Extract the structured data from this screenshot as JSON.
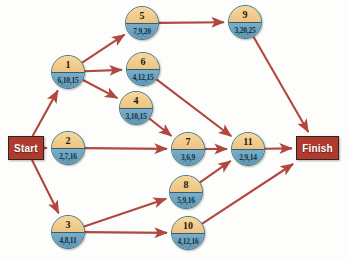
{
  "diagram": {
    "colors": {
      "edge": "#b0483f",
      "terminal_fill": "#b03a2e",
      "terminal_border": "#2b2420",
      "node_top": "#f2cd8b",
      "node_bottom": "#6a9cc0",
      "node_border": "#3c7f96",
      "background": "#fdfdfb"
    },
    "terminals": [
      {
        "key": "start",
        "label": "Start",
        "x": 8,
        "y": 136,
        "w": 36,
        "h": 24
      },
      {
        "key": "finish",
        "label": "Finish",
        "x": 296,
        "y": 136,
        "w": 43,
        "h": 24
      }
    ],
    "nodes": [
      {
        "id": "1",
        "times": "6,10,15",
        "cx": 68,
        "cy": 72
      },
      {
        "id": "2",
        "times": "2,7,16",
        "cx": 68,
        "cy": 148
      },
      {
        "id": "3",
        "times": "4,8,11",
        "cx": 68,
        "cy": 232
      },
      {
        "id": "4",
        "times": "3,10,15",
        "cx": 136,
        "cy": 108
      },
      {
        "id": "5",
        "times": "7,9,20",
        "cx": 142,
        "cy": 23
      },
      {
        "id": "6",
        "times": "4,12,15",
        "cx": 143,
        "cy": 69
      },
      {
        "id": "7",
        "times": "3,6,9",
        "cx": 188,
        "cy": 149
      },
      {
        "id": "8",
        "times": "5,9,16",
        "cx": 186,
        "cy": 192
      },
      {
        "id": "9",
        "times": "3,20,25",
        "cx": 245,
        "cy": 22
      },
      {
        "id": "10",
        "times": "4,12,16",
        "cx": 188,
        "cy": 233
      },
      {
        "id": "11",
        "times": "2,9,14",
        "cx": 248,
        "cy": 149
      }
    ],
    "edges": [
      {
        "from": "start",
        "to": "1"
      },
      {
        "from": "start",
        "to": "2"
      },
      {
        "from": "start",
        "to": "3"
      },
      {
        "from": "1",
        "to": "5"
      },
      {
        "from": "1",
        "to": "6"
      },
      {
        "from": "1",
        "to": "4"
      },
      {
        "from": "5",
        "to": "9"
      },
      {
        "from": "9",
        "to": "finish"
      },
      {
        "from": "6",
        "to": "11"
      },
      {
        "from": "4",
        "to": "7"
      },
      {
        "from": "2",
        "to": "7"
      },
      {
        "from": "7",
        "to": "11"
      },
      {
        "from": "3",
        "to": "8"
      },
      {
        "from": "3",
        "to": "10"
      },
      {
        "from": "8",
        "to": "11"
      },
      {
        "from": "10",
        "to": "finish"
      },
      {
        "from": "11",
        "to": "finish"
      }
    ]
  }
}
